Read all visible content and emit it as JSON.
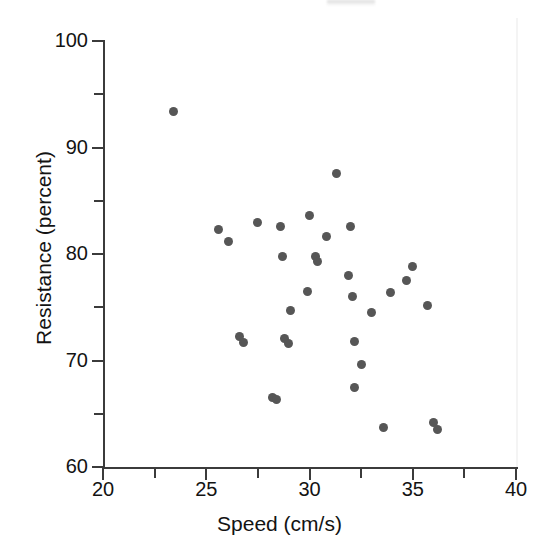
{
  "figure": {
    "background_color": "#ffffff",
    "point_color": "#565656",
    "axis_color": "#3b3b3b",
    "text_color": "#131313"
  },
  "chart_data": {
    "type": "scatter",
    "title": "",
    "xlabel": "Speed (cm/s)",
    "ylabel": "Resistance (percent)",
    "xlim": [
      20,
      40
    ],
    "ylim": [
      60,
      100
    ],
    "xticks": [
      20,
      25,
      30,
      35,
      40
    ],
    "xticklabels": [
      "20",
      "25",
      "30",
      "35",
      "40"
    ],
    "x_minor_ticks": [
      21,
      22,
      23,
      24,
      26,
      27,
      28,
      29,
      31,
      32,
      33,
      34,
      36,
      37,
      38,
      39
    ],
    "yticks": [
      60,
      70,
      80,
      90,
      100
    ],
    "yticklabels": [
      "60",
      "70",
      "80",
      "90",
      "100"
    ],
    "y_minor_ticks": [
      65,
      75,
      85,
      95
    ],
    "grid": false,
    "legend": null,
    "marker": "circle",
    "marker_size_px": 9,
    "n_points": 33,
    "points": [
      {
        "x": 23.4,
        "y": 93.4
      },
      {
        "x": 31.3,
        "y": 87.6
      },
      {
        "x": 30.0,
        "y": 83.6
      },
      {
        "x": 27.5,
        "y": 83.0
      },
      {
        "x": 28.6,
        "y": 82.6
      },
      {
        "x": 32.0,
        "y": 82.6
      },
      {
        "x": 25.6,
        "y": 82.3
      },
      {
        "x": 30.8,
        "y": 81.6
      },
      {
        "x": 26.1,
        "y": 81.2
      },
      {
        "x": 28.7,
        "y": 79.8
      },
      {
        "x": 30.3,
        "y": 79.8
      },
      {
        "x": 30.4,
        "y": 79.3
      },
      {
        "x": 35.0,
        "y": 78.8
      },
      {
        "x": 31.9,
        "y": 78.0
      },
      {
        "x": 34.7,
        "y": 77.5
      },
      {
        "x": 29.9,
        "y": 76.5
      },
      {
        "x": 33.9,
        "y": 76.4
      },
      {
        "x": 32.1,
        "y": 76.0
      },
      {
        "x": 35.7,
        "y": 75.2
      },
      {
        "x": 29.1,
        "y": 74.7
      },
      {
        "x": 33.0,
        "y": 74.5
      },
      {
        "x": 26.6,
        "y": 72.3
      },
      {
        "x": 28.8,
        "y": 72.1
      },
      {
        "x": 32.2,
        "y": 71.8
      },
      {
        "x": 26.8,
        "y": 71.7
      },
      {
        "x": 29.0,
        "y": 71.6
      },
      {
        "x": 32.5,
        "y": 69.6
      },
      {
        "x": 32.2,
        "y": 67.5
      },
      {
        "x": 28.2,
        "y": 66.5
      },
      {
        "x": 28.4,
        "y": 66.3
      },
      {
        "x": 36.0,
        "y": 64.2
      },
      {
        "x": 33.6,
        "y": 63.7
      },
      {
        "x": 36.2,
        "y": 63.5
      }
    ]
  }
}
